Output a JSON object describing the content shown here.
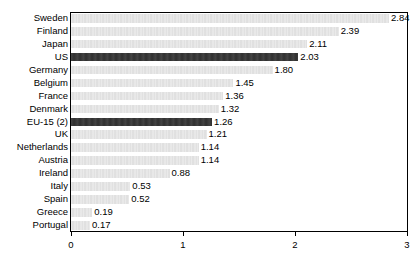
{
  "chart_data": {
    "type": "bar",
    "orientation": "horizontal",
    "title": "",
    "subtitle": "",
    "xlabel": "",
    "ylabel": "",
    "xlim": [
      0,
      3
    ],
    "xticks": [
      "0",
      "1",
      "2",
      "3"
    ],
    "xtick_values": [
      0,
      1,
      2,
      3
    ],
    "grid": false,
    "legend": false,
    "categories": [
      "Sweden",
      "Finland",
      "Japan",
      "US",
      "Germany",
      "Belgium",
      "France",
      "Denmark",
      "EU-15 (2)",
      "UK",
      "Netherlands",
      "Austria",
      "Ireland",
      "Italy",
      "Spain",
      "Greece",
      "Portugal"
    ],
    "values": [
      2.84,
      2.39,
      2.11,
      2.03,
      1.8,
      1.45,
      1.36,
      1.32,
      1.26,
      1.21,
      1.14,
      1.14,
      0.88,
      0.53,
      0.52,
      0.19,
      0.17
    ],
    "value_labels": [
      "2.84",
      "2.39",
      "2.11",
      "2.03",
      "1.80",
      "1.45",
      "1.36",
      "1.32",
      "1.26",
      "1.21",
      "1.14",
      "1.14",
      "0.88",
      "0.53",
      "0.52",
      "0.19",
      "0.17"
    ],
    "highlighted": [
      "US",
      "EU-15 (2)"
    ],
    "colors": {
      "bar_default": "#dcdcdc",
      "bar_highlight": "#303030",
      "axis": "#000000",
      "text": "#000000",
      "background": "#ffffff"
    },
    "bars": [
      {
        "label": "Sweden",
        "value": 2.84,
        "value_label": "2.84",
        "style": "light"
      },
      {
        "label": "Finland",
        "value": 2.39,
        "value_label": "2.39",
        "style": "light"
      },
      {
        "label": "Japan",
        "value": 2.11,
        "value_label": "2.11",
        "style": "light"
      },
      {
        "label": "US",
        "value": 2.03,
        "value_label": "2.03",
        "style": "dark"
      },
      {
        "label": "Germany",
        "value": 1.8,
        "value_label": "1.80",
        "style": "light"
      },
      {
        "label": "Belgium",
        "value": 1.45,
        "value_label": "1.45",
        "style": "light"
      },
      {
        "label": "France",
        "value": 1.36,
        "value_label": "1.36",
        "style": "light"
      },
      {
        "label": "Denmark",
        "value": 1.32,
        "value_label": "1.32",
        "style": "light"
      },
      {
        "label": "EU-15 (2)",
        "value": 1.26,
        "value_label": "1.26",
        "style": "dark"
      },
      {
        "label": "UK",
        "value": 1.21,
        "value_label": "1.21",
        "style": "light"
      },
      {
        "label": "Netherlands",
        "value": 1.14,
        "value_label": "1.14",
        "style": "light"
      },
      {
        "label": "Austria",
        "value": 1.14,
        "value_label": "1.14",
        "style": "light"
      },
      {
        "label": "Ireland",
        "value": 0.88,
        "value_label": "0.88",
        "style": "light"
      },
      {
        "label": "Italy",
        "value": 0.53,
        "value_label": "0.53",
        "style": "light"
      },
      {
        "label": "Spain",
        "value": 0.52,
        "value_label": "0.52",
        "style": "light"
      },
      {
        "label": "Greece",
        "value": 0.19,
        "value_label": "0.19",
        "style": "light"
      },
      {
        "label": "Portugal",
        "value": 0.17,
        "value_label": "0.17",
        "style": "light"
      }
    ]
  }
}
